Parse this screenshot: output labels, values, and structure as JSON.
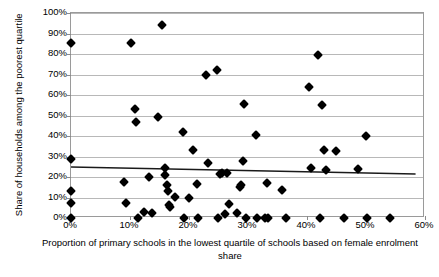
{
  "chart_data": {
    "type": "scatter",
    "title": "",
    "xlabel": "Proportion of primary schools in the lowest quartile of schools based on female enrolment share",
    "ylabel": "Share of households among the poorest quartile",
    "xlim": [
      0,
      60
    ],
    "ylim": [
      0,
      100
    ],
    "xticks": [
      "0%",
      "10%",
      "20%",
      "30%",
      "40%",
      "50%",
      "60%"
    ],
    "xtick_values": [
      0,
      10,
      20,
      30,
      40,
      50,
      60
    ],
    "yticks": [
      "0%",
      "10%",
      "20%",
      "30%",
      "40%",
      "50%",
      "60%",
      "70%",
      "80%",
      "90%",
      "100%"
    ],
    "ytick_values": [
      0,
      10,
      20,
      30,
      40,
      50,
      60,
      70,
      80,
      90,
      100
    ],
    "grid": "horizontal",
    "legend": "none",
    "marker": "filled-diamond",
    "marker_color": "#000000",
    "series": [
      {
        "name": "countries",
        "points": [
          [
            0.0,
            85.5
          ],
          [
            0.0,
            28.8
          ],
          [
            0.0,
            13.3
          ],
          [
            0.0,
            7.4
          ],
          [
            0.0,
            0.0
          ],
          [
            9.0,
            17.8
          ],
          [
            9.3,
            7.2
          ],
          [
            10.2,
            85.4
          ],
          [
            10.8,
            53.4
          ],
          [
            11.0,
            46.8
          ],
          [
            11.4,
            0.0
          ],
          [
            12.4,
            2.9
          ],
          [
            13.2,
            19.9
          ],
          [
            13.7,
            2.6
          ],
          [
            14.7,
            49.5
          ],
          [
            15.4,
            94.2
          ],
          [
            15.9,
            24.5
          ],
          [
            16.0,
            20.8
          ],
          [
            16.3,
            16.2
          ],
          [
            16.4,
            13.0
          ],
          [
            16.6,
            6.5
          ],
          [
            16.8,
            5.4
          ],
          [
            17.6,
            10.2
          ],
          [
            18.9,
            41.9
          ],
          [
            19.1,
            0.0
          ],
          [
            20.0,
            9.8
          ],
          [
            20.6,
            33.2
          ],
          [
            21.4,
            16.7
          ],
          [
            21.6,
            0.0
          ],
          [
            22.9,
            69.6
          ],
          [
            23.2,
            26.6
          ],
          [
            24.8,
            72.2
          ],
          [
            24.9,
            0.0
          ],
          [
            25.2,
            21.3
          ],
          [
            25.6,
            22.1
          ],
          [
            26.1,
            2.0
          ],
          [
            26.5,
            22.0
          ],
          [
            26.7,
            6.8
          ],
          [
            28.1,
            2.3
          ],
          [
            28.6,
            15.0
          ],
          [
            28.8,
            16.3
          ],
          [
            29.2,
            27.8
          ],
          [
            29.4,
            55.6
          ],
          [
            29.7,
            0.0
          ],
          [
            31.3,
            40.4
          ],
          [
            31.6,
            0.0
          ],
          [
            32.8,
            0.0
          ],
          [
            33.2,
            17.2
          ],
          [
            33.4,
            0.0
          ],
          [
            35.7,
            13.9
          ],
          [
            36.4,
            0.0
          ],
          [
            40.3,
            63.8
          ],
          [
            40.6,
            24.2
          ],
          [
            41.8,
            79.6
          ],
          [
            42.2,
            0.0
          ],
          [
            42.6,
            55.2
          ],
          [
            42.9,
            33.2
          ],
          [
            43.3,
            23.2
          ],
          [
            44.9,
            32.8
          ],
          [
            46.3,
            0.0
          ],
          [
            48.6,
            24.1
          ],
          [
            50.0,
            40.2
          ],
          [
            50.1,
            0.0
          ],
          [
            54.0,
            0.0
          ]
        ]
      }
    ],
    "trendline": {
      "type": "linear",
      "x_start": 0.0,
      "y_start": 24.9,
      "x_end": 58.4,
      "y_end": 21.5,
      "color": "#1a1a1a"
    }
  }
}
